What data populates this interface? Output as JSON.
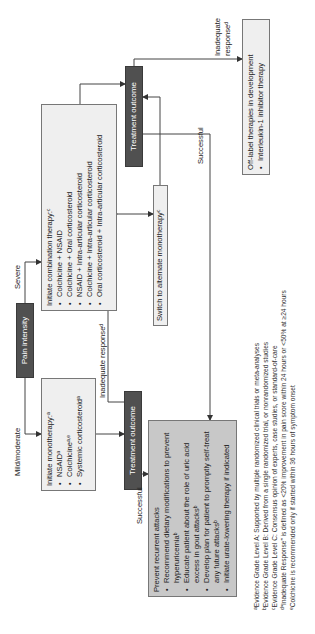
{
  "pain_intensity": "Pain intensity",
  "branches": {
    "mild": "Mild/moderate",
    "severe": "Severe"
  },
  "mono": {
    "title": "Initiate monotherapy:",
    "title_sup": "a",
    "items": [
      {
        "label": "NSAID",
        "sup": "a"
      },
      {
        "label": "Colchicine",
        "sup": "a,e"
      },
      {
        "label": "Systemic corticosteroid",
        "sup": "a"
      }
    ]
  },
  "combo": {
    "title": "Initiate combination therapy:",
    "title_sup": "c",
    "items": [
      {
        "label": "Colchicine + NSAID"
      },
      {
        "label": "Colchicine + Oral corticosteroid"
      },
      {
        "label": "NSAID + Intra-articular corticosteroid"
      },
      {
        "label": "Colchicine + Intra-articular corticosteroid"
      },
      {
        "label": "Oral corticosteroid + Intra-articular corticosteroid"
      }
    ]
  },
  "treatment_outcome_left": "Treatment outcome",
  "treatment_outcome_right": "Treatment outcome",
  "edges": {
    "inadequate_left": "Inadequate response",
    "inadequate_left_sup": "d",
    "successful_left": "Successful",
    "successful_right": "Successful",
    "inadequate_right_1": "Inadequate",
    "inadequate_right_2": "response",
    "inadequate_right_sup": "d"
  },
  "switch": {
    "label": "Switch to alternate monotherapy",
    "sup": "c"
  },
  "prevent": {
    "title": "Prevent recurrent attacks",
    "items": [
      {
        "label": "Recommend dietary modifications to prevent hyperuricemia",
        "sup": "b"
      },
      {
        "label": "Educate patient about the role of uric acid excess in gout attacks",
        "sup": "b"
      },
      {
        "label": "Develop plan for patient to promptly self-treat any future attacks",
        "sup": "b"
      },
      {
        "label": "Initiate urate-lowering therapy if indicated"
      }
    ]
  },
  "offlabel": {
    "title": "Off-label therapies in development",
    "items": [
      {
        "label": "Interleukin-1 inhibitor therapy"
      }
    ]
  },
  "footnotes": [
    {
      "sup": "a",
      "text": "Evidence Grade Level A: Supported by multiple randomized clinical trials or meta-analyses"
    },
    {
      "sup": "b",
      "text": "Evidence Grade Level B: Derived from a single randomized trial, or nonrandomized studies"
    },
    {
      "sup": "c",
      "text": "Evidence Grade Level C: Consensus opinion of experts, case studies, or standard-of-care"
    },
    {
      "sup": "d",
      "text": "“Inadequate Response” is defined as <20% improvement in pain score within 24 hours or <50% at ≥24 hours"
    },
    {
      "sup": "e",
      "text": "Colchicine is recommended only if started within 36 hours of symptom onset"
    }
  ],
  "colors": {
    "dark_box": "#505050",
    "gray_box": "#c8c8c8",
    "light_box": "#efefef",
    "line": "#444444"
  }
}
